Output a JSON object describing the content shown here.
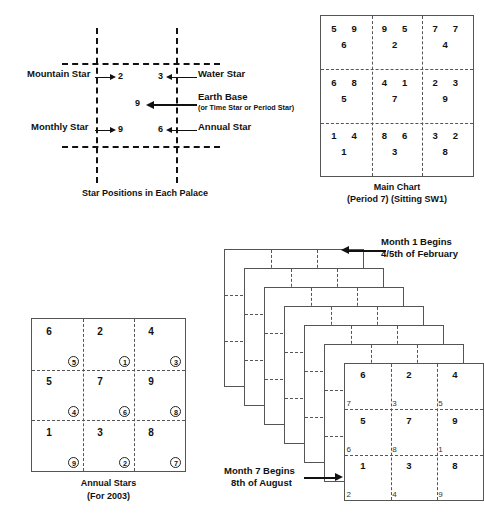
{
  "palace_diagram": {
    "caption": "Star Positions in Each Palace",
    "labels": {
      "mountain_star": "Mountain Star",
      "water_star": "Water Star",
      "earth_base": "Earth Base",
      "earth_base_sub": "(or Time Star or Period Star)",
      "monthly_star": "Monthly Star",
      "annual_star": "Annual Star"
    },
    "values": {
      "mountain_star": "2",
      "water_star": "3",
      "earth_base": "9",
      "monthly_star": "9",
      "annual_star": "6"
    }
  },
  "main_chart": {
    "caption_line1": "Main Chart",
    "caption_line2": "(Period 7)  (Sitting SW1)",
    "cells": [
      {
        "a": "5",
        "b": "9",
        "c": "6"
      },
      {
        "a": "9",
        "b": "5",
        "c": "2"
      },
      {
        "a": "7",
        "b": "7",
        "c": "4"
      },
      {
        "a": "6",
        "b": "8",
        "c": "5"
      },
      {
        "a": "4",
        "b": "1",
        "c": "7"
      },
      {
        "a": "2",
        "b": "3",
        "c": "9"
      },
      {
        "a": "1",
        "b": "4",
        "c": "1"
      },
      {
        "a": "8",
        "b": "6",
        "c": "3"
      },
      {
        "a": "3",
        "b": "2",
        "c": "8"
      }
    ]
  },
  "annual_chart": {
    "caption_line1": "Annual Stars",
    "caption_line2": "(For 2003)",
    "cells": [
      {
        "main": "6",
        "circled": "5"
      },
      {
        "main": "2",
        "circled": "1"
      },
      {
        "main": "4",
        "circled": "3"
      },
      {
        "main": "5",
        "circled": "4"
      },
      {
        "main": "7",
        "circled": "6"
      },
      {
        "main": "9",
        "circled": "8"
      },
      {
        "main": "1",
        "circled": "9"
      },
      {
        "main": "3",
        "circled": "2"
      },
      {
        "main": "8",
        "circled": "7"
      }
    ]
  },
  "monthly_stack": {
    "top_note_line1": "Month 1 Begins",
    "top_note_line2": "4/5th of February",
    "bottom_note_line1": "Month 7 Begins",
    "bottom_note_line2": "8th of August",
    "sheet_count": 7,
    "front_chart": {
      "cells": [
        {
          "big": "6",
          "small": "7"
        },
        {
          "big": "2",
          "small": "3"
        },
        {
          "big": "4",
          "small": "5"
        },
        {
          "big": "5",
          "small": "6"
        },
        {
          "big": "7",
          "small": "8"
        },
        {
          "big": "9",
          "small": "1"
        },
        {
          "big": "1",
          "small": "2"
        },
        {
          "big": "3",
          "small": "4"
        },
        {
          "big": "8",
          "small": "9"
        }
      ]
    }
  },
  "colors": {
    "ink": "#111111",
    "chart_border": "#555555",
    "background": "#ffffff"
  }
}
